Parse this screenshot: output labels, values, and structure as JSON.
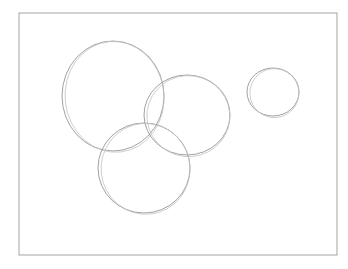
{
  "drawing": {
    "description": "Pencil sketch of four overlapping circles inside a rectangular frame",
    "stroke_color": "#8a8a8a",
    "light_stroke_color": "#c4c4c4",
    "background": "#ffffff",
    "frame": {
      "x": 19,
      "y": 13,
      "width": 318,
      "height": 242,
      "color": "#9a9a9a"
    },
    "circles": [
      {
        "name": "large-circle-upper-left",
        "cx": 113,
        "cy": 96,
        "rx": 51,
        "ry": 55
      },
      {
        "name": "circle-middle-right",
        "cx": 187,
        "cy": 115,
        "rx": 43,
        "ry": 40
      },
      {
        "name": "circle-bottom",
        "cx": 144,
        "cy": 168,
        "rx": 46,
        "ry": 45
      },
      {
        "name": "small-circle-right",
        "cx": 273,
        "cy": 92,
        "rx": 26,
        "ry": 24
      }
    ]
  }
}
